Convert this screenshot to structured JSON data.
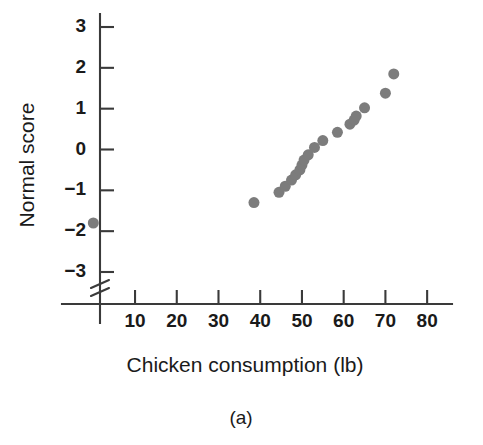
{
  "figure": {
    "caption": "(a)",
    "dot_color": "#7c7c7c",
    "axis_color": "#3a3a3a",
    "background": "#ffffff"
  },
  "chart_data": {
    "type": "scatter",
    "title": "",
    "subtitle": "",
    "caption": "(a)",
    "xlabel": "Chicken consumption (lb)",
    "ylabel": "Normal score",
    "xlim": [
      0,
      85
    ],
    "ylim": [
      -3.6,
      3.4
    ],
    "xticks": [
      10,
      20,
      30,
      40,
      50,
      60,
      70,
      80
    ],
    "xtick_labels": [
      "10",
      "20",
      "30",
      "40",
      "50",
      "60",
      "70",
      "80"
    ],
    "yticks": [
      -3,
      -2,
      -1,
      0,
      1,
      2,
      3
    ],
    "ytick_labels": [
      "−3",
      "−2",
      "−1",
      "0",
      "1",
      "2",
      "3"
    ],
    "grid": false,
    "legend": false,
    "y_axis_break": true,
    "y_axis_break_note": "axis break below -3",
    "marker": "circle",
    "marker_size_px": 11,
    "n_points": 19,
    "x": [
      0,
      38.5,
      44.5,
      46.0,
      47.5,
      48.5,
      49.5,
      50.0,
      50.5,
      51.5,
      53.0,
      55.0,
      58.5,
      61.5,
      62.5,
      63.0,
      65.0,
      70.0,
      72.0
    ],
    "y": [
      -1.8,
      -1.3,
      -1.05,
      -0.9,
      -0.75,
      -0.62,
      -0.5,
      -0.38,
      -0.26,
      -0.13,
      0.05,
      0.22,
      0.42,
      0.62,
      0.72,
      0.82,
      1.02,
      1.38,
      1.85
    ],
    "points": [
      {
        "x": 0,
        "y": -1.8,
        "note": "outlier plotted on broken y-axis"
      },
      {
        "x": 38.5,
        "y": -1.3
      },
      {
        "x": 44.5,
        "y": -1.05
      },
      {
        "x": 46.0,
        "y": -0.9
      },
      {
        "x": 47.5,
        "y": -0.75
      },
      {
        "x": 48.5,
        "y": -0.62
      },
      {
        "x": 49.5,
        "y": -0.5
      },
      {
        "x": 50.0,
        "y": -0.38
      },
      {
        "x": 50.5,
        "y": -0.26
      },
      {
        "x": 51.5,
        "y": -0.13
      },
      {
        "x": 53.0,
        "y": 0.05
      },
      {
        "x": 55.0,
        "y": 0.22
      },
      {
        "x": 58.5,
        "y": 0.42
      },
      {
        "x": 61.5,
        "y": 0.62
      },
      {
        "x": 62.5,
        "y": 0.72
      },
      {
        "x": 63.0,
        "y": 0.82
      },
      {
        "x": 65.0,
        "y": 1.02
      },
      {
        "x": 70.0,
        "y": 1.38
      },
      {
        "x": 72.0,
        "y": 1.85
      }
    ]
  }
}
